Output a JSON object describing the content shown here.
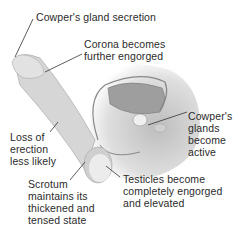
{
  "diagram": {
    "colors": {
      "background": "#ffffff",
      "text": "#2b2b2b",
      "leader_line": "#333333",
      "body_fill": "#d9d9d9",
      "organ_fill": "#c4c4c4",
      "highlight": "#eeeeee"
    },
    "labels": [
      {
        "id": "cowpers-secretion",
        "text": "Cowper's gland secretion"
      },
      {
        "id": "corona",
        "text": "Corona becomes\nfurther engorged"
      },
      {
        "id": "erection",
        "text": "Loss of\nerection\nless likely"
      },
      {
        "id": "cowpers-glands",
        "text": "Cowper's\nglands\nbecome\nactive"
      },
      {
        "id": "scrotum",
        "text": "Scrotum\nmaintains its\nthickened and\ntensed state"
      },
      {
        "id": "testicles",
        "text": "Testicles become\ncompletely engorged\nand elevated"
      }
    ]
  }
}
